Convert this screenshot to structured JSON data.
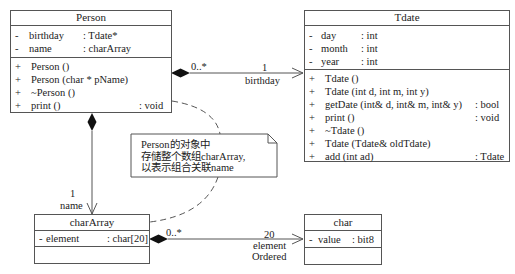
{
  "classes": {
    "person": {
      "name": "Person",
      "attributes": [
        {
          "vis": "-",
          "name": "birthday",
          "type": ": Tdate*"
        },
        {
          "vis": "-",
          "name": "name",
          "type": ": charArray"
        }
      ],
      "operations": [
        {
          "vis": "+",
          "name": "Person ()",
          "type": ""
        },
        {
          "vis": "+",
          "name": "Person (char * pName)",
          "type": ""
        },
        {
          "vis": "+",
          "name": "~Person ()",
          "type": ""
        },
        {
          "vis": "+",
          "name": "print ()",
          "type": ": void"
        }
      ]
    },
    "tdate": {
      "name": "Tdate",
      "attributes": [
        {
          "vis": "-",
          "name": "day",
          "type": ": int"
        },
        {
          "vis": "-",
          "name": "month",
          "type": ": int"
        },
        {
          "vis": "-",
          "name": "year",
          "type": ": int"
        }
      ],
      "operations": [
        {
          "vis": "+",
          "name": "Tdate ()",
          "type": ""
        },
        {
          "vis": "+",
          "name": "Tdate (int d, int m, int y)",
          "type": ""
        },
        {
          "vis": "+",
          "name": "getDate (int& d, int& m, int& y)",
          "type": ": bool"
        },
        {
          "vis": "+",
          "name": "print ()",
          "type": ": void"
        },
        {
          "vis": "+",
          "name": "~Tdate ()",
          "type": ""
        },
        {
          "vis": "+",
          "name": "Tdate (Tdate& oldTdate)",
          "type": ""
        },
        {
          "vis": "+",
          "name": "add (int ad)",
          "type": ": Tdate"
        }
      ]
    },
    "chararray": {
      "name": "charArray",
      "attributes": [
        {
          "vis": "-",
          "name": "element",
          "type": ": char[20]"
        }
      ],
      "operations": []
    },
    "char": {
      "name": "char",
      "attributes": [
        {
          "vis": "-",
          "name": "value",
          "type": ": bit8"
        }
      ],
      "operations": []
    }
  },
  "associations": {
    "person_tdate": {
      "source_mult": "0..*",
      "target_mult": "1",
      "role": "birthday"
    },
    "person_chararray": {
      "target_mult": "1",
      "role": "name"
    },
    "chararray_char": {
      "source_mult": "0..*",
      "target_mult": "20",
      "role": "element",
      "constraint": "Ordered"
    }
  },
  "note": {
    "lines": [
      "Person的对象中",
      "存储整个数组charArray,",
      "以表示组合关联name"
    ]
  },
  "colors": {
    "line": "#555555",
    "text": "#222222",
    "background": "#ffffff"
  }
}
